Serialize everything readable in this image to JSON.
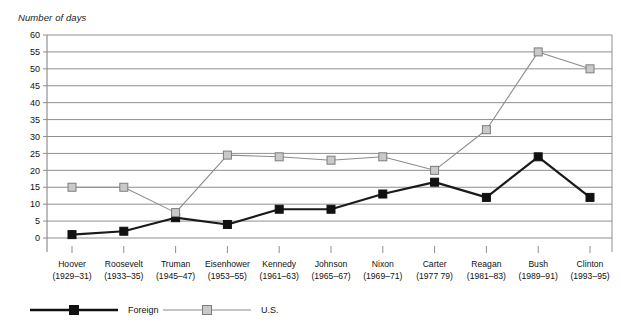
{
  "chart_data": {
    "type": "line",
    "title": "",
    "ylabel": "Number of days",
    "xlabel": "",
    "ylim": [
      0,
      60
    ],
    "yticks": [
      0,
      5,
      10,
      15,
      20,
      25,
      30,
      35,
      40,
      45,
      50,
      55,
      60
    ],
    "grid": true,
    "legend_position": "bottom",
    "categories": [
      "Hoover",
      "Roosevelt",
      "Truman",
      "Eisenhower",
      "Kennedy",
      "Johnson",
      "Nixon",
      "Carter",
      "Reagan",
      "Bush",
      "Clinton"
    ],
    "category_years": [
      "(1929–31)",
      "(1933–35)",
      "(1945–47)",
      "(1953–55)",
      "(1961–63)",
      "(1965–67)",
      "(1969–71)",
      "(1977 79)",
      "(1981–83)",
      "(1989–91)",
      "(1993–95)"
    ],
    "series": [
      {
        "name": "Foreign",
        "color": "#1a1a1a",
        "marker": "filled-square",
        "values": [
          1,
          2,
          6,
          4,
          8.5,
          8.5,
          13,
          16.5,
          12,
          24,
          12
        ]
      },
      {
        "name": "U.S.",
        "color": "#8c8c8c",
        "marker": "open-square",
        "values": [
          15,
          15,
          7.5,
          24.5,
          24,
          23,
          24,
          20,
          32,
          55,
          50
        ]
      }
    ]
  },
  "legend": {
    "items": [
      {
        "label": "Foreign"
      },
      {
        "label": "U.S."
      }
    ]
  }
}
